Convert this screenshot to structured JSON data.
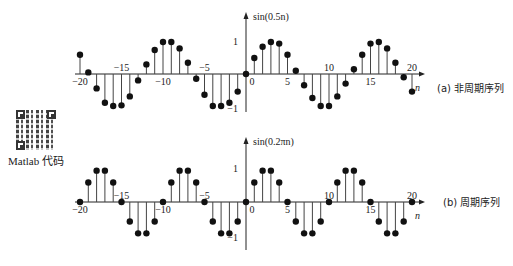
{
  "qr": {
    "label": "Matlab 代码"
  },
  "chart_data": [
    {
      "type": "stem",
      "title": "sin(0.5n)",
      "caption": "(a) 非周期序列",
      "xlabel": "n",
      "ylabel": "sin(0.5n)",
      "x_ticks": [
        -20,
        -15,
        -10,
        -5,
        0,
        5,
        10,
        15,
        20
      ],
      "y_ticks": [
        -1,
        1
      ],
      "xlim": [
        -20,
        20
      ],
      "ylim": [
        -1,
        1
      ],
      "x": [
        -20,
        -19,
        -18,
        -17,
        -16,
        -15,
        -14,
        -13,
        -12,
        -11,
        -10,
        -9,
        -8,
        -7,
        -6,
        -5,
        -4,
        -3,
        -2,
        -1,
        0,
        1,
        2,
        3,
        4,
        5,
        6,
        7,
        8,
        9,
        10,
        11,
        12,
        13,
        14,
        15,
        16,
        17,
        18,
        19,
        20
      ],
      "values": [
        0.6,
        0.05,
        -0.45,
        -0.9,
        -1.0,
        -0.98,
        -0.7,
        -0.2,
        0.3,
        0.75,
        1.0,
        1.0,
        0.8,
        0.35,
        -0.15,
        -0.65,
        -1.0,
        -1.0,
        -0.9,
        -0.55,
        0,
        0.5,
        0.85,
        1.0,
        0.95,
        0.6,
        0.1,
        -0.35,
        -0.75,
        -1.0,
        -1.0,
        -0.7,
        -0.3,
        0.15,
        0.6,
        0.95,
        1.0,
        0.8,
        0.35,
        -0.1,
        -0.55
      ]
    },
    {
      "type": "stem",
      "title": "sin(0.2πn)",
      "caption": "(b) 周期序列",
      "xlabel": "n",
      "ylabel": "sin(0.2πn)",
      "x_ticks": [
        -20,
        -15,
        -10,
        -5,
        0,
        5,
        10,
        15,
        20
      ],
      "y_ticks": [
        -1,
        1
      ],
      "xlim": [
        -20,
        20
      ],
      "ylim": [
        -1,
        1
      ],
      "x": [
        -20,
        -19,
        -18,
        -17,
        -16,
        -15,
        -14,
        -13,
        -12,
        -11,
        -10,
        -9,
        -8,
        -7,
        -6,
        -5,
        -4,
        -3,
        -2,
        -1,
        0,
        1,
        2,
        3,
        4,
        5,
        6,
        7,
        8,
        9,
        10,
        11,
        12,
        13,
        14,
        15,
        16,
        17,
        18,
        19,
        20
      ],
      "values": [
        0,
        0.59,
        0.95,
        0.95,
        0.59,
        0,
        -0.59,
        -0.95,
        -0.95,
        -0.59,
        0,
        0.59,
        0.95,
        0.95,
        0.59,
        0,
        -0.59,
        -0.95,
        -0.95,
        -0.59,
        0,
        0.59,
        0.95,
        0.95,
        0.59,
        0,
        -0.59,
        -0.95,
        -0.95,
        -0.59,
        0,
        0.59,
        0.95,
        0.95,
        0.59,
        0,
        -0.59,
        -0.95,
        -0.95,
        -0.59,
        0
      ]
    }
  ]
}
